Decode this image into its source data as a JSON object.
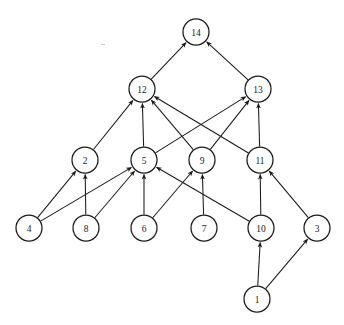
{
  "figure": {
    "caption": "",
    "background_color": "#ffffff",
    "node_fill": "#ffffff",
    "node_stroke": "#1a1a1a",
    "edge_color": "#1a1a1a",
    "width": 344,
    "height": 325
  },
  "chart_data": {
    "type": "diagram",
    "diagram_type": "directed-acyclic-graph",
    "title": "",
    "node_radius": 13,
    "nodes": [
      {
        "id": "14",
        "label": "14",
        "x": 196,
        "y": 32,
        "level": 0
      },
      {
        "id": "12",
        "label": "12",
        "x": 142,
        "y": 89,
        "level": 1
      },
      {
        "id": "13",
        "label": "13",
        "x": 258,
        "y": 89,
        "level": 1
      },
      {
        "id": "2",
        "label": "2",
        "x": 85,
        "y": 160,
        "level": 2
      },
      {
        "id": "5",
        "label": "5",
        "x": 144,
        "y": 160,
        "level": 2
      },
      {
        "id": "9",
        "label": "9",
        "x": 202,
        "y": 160,
        "level": 2
      },
      {
        "id": "11",
        "label": "11",
        "x": 260,
        "y": 160,
        "level": 2
      },
      {
        "id": "4",
        "label": "4",
        "x": 29,
        "y": 228,
        "level": 3
      },
      {
        "id": "8",
        "label": "8",
        "x": 86,
        "y": 228,
        "level": 3
      },
      {
        "id": "6",
        "label": "6",
        "x": 144,
        "y": 228,
        "level": 3
      },
      {
        "id": "7",
        "label": "7",
        "x": 204,
        "y": 228,
        "level": 3
      },
      {
        "id": "10",
        "label": "10",
        "x": 261,
        "y": 228,
        "level": 3
      },
      {
        "id": "3",
        "label": "3",
        "x": 317,
        "y": 228,
        "level": 3
      },
      {
        "id": "1",
        "label": "1",
        "x": 257,
        "y": 299,
        "level": 4
      }
    ],
    "edges": [
      {
        "from": "1",
        "to": "10"
      },
      {
        "from": "1",
        "to": "3"
      },
      {
        "from": "10",
        "to": "11"
      },
      {
        "from": "10",
        "to": "5"
      },
      {
        "from": "3",
        "to": "11"
      },
      {
        "from": "7",
        "to": "9"
      },
      {
        "from": "6",
        "to": "9"
      },
      {
        "from": "6",
        "to": "5"
      },
      {
        "from": "8",
        "to": "5"
      },
      {
        "from": "8",
        "to": "2"
      },
      {
        "from": "4",
        "to": "5"
      },
      {
        "from": "4",
        "to": "2"
      },
      {
        "from": "2",
        "to": "12"
      },
      {
        "from": "5",
        "to": "12"
      },
      {
        "from": "5",
        "to": "13"
      },
      {
        "from": "9",
        "to": "12"
      },
      {
        "from": "9",
        "to": "13"
      },
      {
        "from": "11",
        "to": "12"
      },
      {
        "from": "11",
        "to": "13"
      },
      {
        "from": "12",
        "to": "14"
      },
      {
        "from": "13",
        "to": "14"
      }
    ],
    "directed": true,
    "arrowheads": true,
    "legend": null,
    "grid": false
  }
}
